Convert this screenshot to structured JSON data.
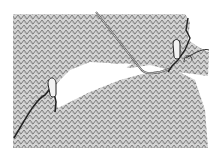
{
  "illustration": {
    "subject": "knitting technique diagram",
    "colors": {
      "background": "#ffffff",
      "fabric": "#9a9a9a",
      "fabric_light": "#d8d8d8",
      "yarn": "#333333",
      "needle": "#666666"
    }
  }
}
